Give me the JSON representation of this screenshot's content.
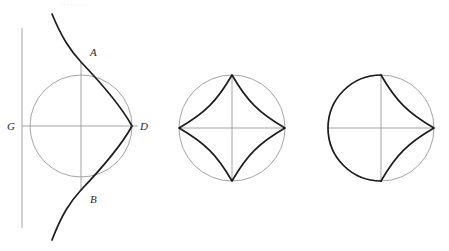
{
  "page": {
    "background_color": "#ffffff",
    "width": 449,
    "height": 251,
    "top_cut_text": ". . .  .        .        .        .        ."
  },
  "styles": {
    "thin_stroke_color": "#9a9a9a",
    "bold_stroke_color": "#1c1c1c",
    "thin_stroke_width": 0.9,
    "bold_stroke_width": 1.7,
    "label_color": "#2a2a2a"
  },
  "figures": [
    {
      "id": "figure-left",
      "name": "cissoid-with-tangent-line",
      "center": {
        "x": 81,
        "y": 126
      },
      "radius": 51,
      "circle_style": "thin",
      "tangent_line": {
        "name": "vertical-tangent-line",
        "x": 22,
        "y_start": 28,
        "y_end": 228,
        "style": "thin"
      },
      "horizontal_diameter": {
        "name": "diameter-g-d",
        "x_start": 22,
        "x_end": 138,
        "y": 126,
        "style": "thin"
      },
      "vertical_chord": {
        "name": "chord-a-b",
        "x": 81,
        "y_start": 62,
        "y_end": 190,
        "style": "thin"
      },
      "bold_curve": {
        "name": "cissoid-curve",
        "style": "bold",
        "description": "cusped curve through A, cusp at D, through B",
        "top_end": {
          "x": 52,
          "y": 14
        },
        "bottom_end": {
          "x": 52,
          "y": 240
        },
        "cusp": {
          "x": 132,
          "y": 126
        }
      },
      "labels": [
        {
          "name": "label-a",
          "text": "A",
          "x": 90,
          "y": 56
        },
        {
          "name": "label-b",
          "text": "B",
          "x": 90,
          "y": 203
        },
        {
          "name": "label-g",
          "text": "G",
          "x": 7,
          "y": 130
        },
        {
          "name": "label-d",
          "text": "D",
          "x": 140,
          "y": 130
        }
      ]
    },
    {
      "id": "figure-middle",
      "name": "astroid-in-circle",
      "center": {
        "x": 232,
        "y": 128
      },
      "radius": 53,
      "circle_style": "thin",
      "horizontal_diameter": {
        "name": "horizontal-diameter",
        "x_start": 179,
        "x_end": 285,
        "y": 128,
        "style": "thin"
      },
      "vertical_diameter": {
        "name": "vertical-diameter",
        "x": 232,
        "y_start": 75,
        "y_end": 181,
        "style": "thin"
      },
      "bold_curve": {
        "name": "astroid-four-cusp-curve",
        "style": "bold",
        "description": "four concave arcs joining top, right, bottom and left cardinal points",
        "cusps": [
          {
            "x": 232,
            "y": 75
          },
          {
            "x": 285,
            "y": 128
          },
          {
            "x": 232,
            "y": 181
          },
          {
            "x": 179,
            "y": 128
          }
        ]
      },
      "labels": []
    },
    {
      "id": "figure-right",
      "name": "semicircle-with-two-cusped-arcs",
      "center": {
        "x": 381,
        "y": 128
      },
      "radius": 53,
      "circle_style": "thin",
      "horizontal_diameter": {
        "name": "horizontal-diameter",
        "x_start": 328,
        "x_end": 434,
        "y": 128,
        "style": "thin"
      },
      "vertical_diameter": {
        "name": "vertical-diameter",
        "x": 381,
        "y_start": 75,
        "y_end": 181,
        "style": "thin"
      },
      "bold_semicircle": {
        "name": "bold-left-semicircle",
        "style": "bold",
        "from": {
          "x": 381,
          "y": 75
        },
        "to": {
          "x": 381,
          "y": 181
        },
        "side": "left"
      },
      "bold_curve": {
        "name": "two-concave-arcs",
        "style": "bold",
        "description": "upper and lower concave arcs meeting at right point",
        "cusps": [
          {
            "x": 381,
            "y": 75
          },
          {
            "x": 434,
            "y": 128
          },
          {
            "x": 381,
            "y": 181
          }
        ]
      },
      "labels": []
    }
  ]
}
